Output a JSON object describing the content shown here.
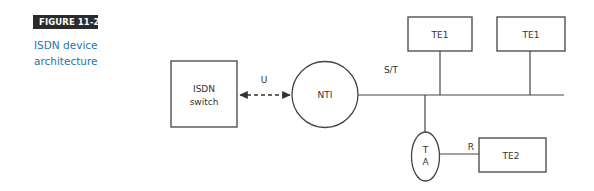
{
  "figure": {
    "label": "FIGURE 11-2",
    "caption": "ISDN device architecture",
    "label_bg": "#2b2b2b",
    "caption_color": "#1a75b0"
  },
  "diagram": {
    "nodes": {
      "isdn_switch": {
        "line1": "ISDN",
        "line2": "switch"
      },
      "nti": {
        "label": "NTI"
      },
      "te1_a": {
        "label": "TE1"
      },
      "te1_b": {
        "label": "TE1"
      },
      "ta": {
        "line1": "T",
        "line2": "A"
      },
      "te2": {
        "label": "TE2"
      }
    },
    "interfaces": {
      "u": "U",
      "st": "S/T",
      "r": "R"
    },
    "stroke_color": "#444444"
  }
}
